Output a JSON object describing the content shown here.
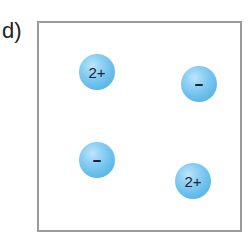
{
  "panel": {
    "label": "d)"
  },
  "ions": [
    {
      "id": "ion-1",
      "charge": "2+",
      "type": "cation",
      "cx": 97,
      "cy": 72
    },
    {
      "id": "ion-2",
      "charge": "-",
      "type": "anion",
      "cx": 199,
      "cy": 84
    },
    {
      "id": "ion-3",
      "charge": "-",
      "type": "anion",
      "cx": 97,
      "cy": 160
    },
    {
      "id": "ion-4",
      "charge": "2+",
      "type": "cation",
      "cx": 193,
      "cy": 181
    }
  ],
  "colors": {
    "ion_fill": "#6cc0ee",
    "ion_highlight": "#bfe6fb",
    "border": "#9a9a9a",
    "text": "#1c2233"
  }
}
